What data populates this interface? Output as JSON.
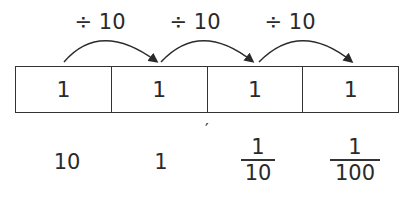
{
  "operations": [
    {
      "label": "÷ 10"
    },
    {
      "label": "÷ 10"
    },
    {
      "label": "÷ 10"
    }
  ],
  "cells": [
    "1",
    "1",
    "1",
    "1"
  ],
  "tick_mark": "′",
  "values": {
    "v0": "10",
    "v1": "1",
    "v2": {
      "numerator": "1",
      "denominator": "10"
    },
    "v3": {
      "numerator": "1",
      "denominator": "100"
    }
  }
}
